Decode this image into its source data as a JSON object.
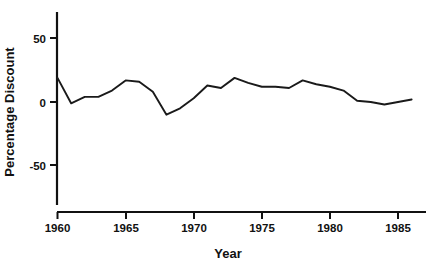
{
  "chart_data": {
    "type": "line",
    "title": "",
    "subtitle": "",
    "xlabel": "Year",
    "ylabel": "Percentage Discount",
    "xlim": [
      1960,
      1986.8
    ],
    "ylim": [
      -72,
      64
    ],
    "grid": false,
    "legend": null,
    "legend_position": "none",
    "line_color": "#1a1a1a",
    "xticks": [
      1960,
      1965,
      1970,
      1975,
      1980,
      1985
    ],
    "xtick_labels": [
      "1960",
      "1965",
      "1970",
      "1975",
      "1980",
      "1985"
    ],
    "yticks": [
      50,
      0,
      -50
    ],
    "ytick_labels": [
      "50",
      "0",
      "-50"
    ],
    "series": [
      {
        "name": "Percentage Discount",
        "x": [
          1960,
          1961,
          1962,
          1963,
          1964,
          1965,
          1966,
          1967,
          1968,
          1969,
          1970,
          1971,
          1972,
          1973,
          1974,
          1975,
          1976,
          1977,
          1978,
          1979,
          1980,
          1981,
          1982,
          1983,
          1984,
          1985,
          1986
        ],
        "values": [
          19,
          -1,
          4,
          4,
          9,
          17,
          16,
          8,
          -10,
          -5,
          3,
          13,
          11,
          19,
          15,
          12,
          12,
          11,
          17,
          14,
          12,
          9,
          1,
          0,
          -2,
          0,
          2
        ]
      }
    ]
  },
  "axes": {
    "y_axis_name": "percentage-discount-axis",
    "x_axis_name": "year-axis"
  }
}
